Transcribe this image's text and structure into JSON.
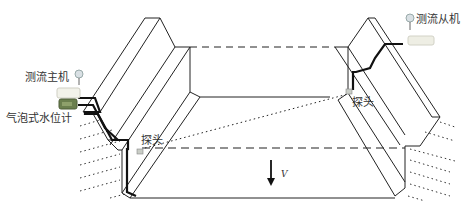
{
  "diagram": {
    "title": "",
    "labels": {
      "main_unit": "测流主机",
      "slave_unit": "测流从机",
      "bubble_gauge": "气泡式水位计",
      "probe_left": "探头",
      "probe_right": "探头",
      "velocity": "V"
    },
    "colors": {
      "line": "#222222",
      "cable": "#111111",
      "main_unit_body": "#f2f2ea",
      "gauge_body": "#6b7f4e",
      "slave_unit_body": "#eeeee4",
      "label_text": "#333333"
    },
    "nodes": [
      {
        "id": "main-unit",
        "label": "测流主机",
        "type": "instrument"
      },
      {
        "id": "bubble-gauge",
        "label": "气泡式水位计",
        "type": "instrument"
      },
      {
        "id": "slave-unit",
        "label": "测流从机",
        "type": "instrument"
      },
      {
        "id": "probe-left",
        "label": "探头",
        "type": "sensor"
      },
      {
        "id": "probe-right",
        "label": "探头",
        "type": "sensor"
      },
      {
        "id": "channel",
        "label": "",
        "type": "trapezoidal-channel"
      }
    ],
    "edges": [
      {
        "from": "main-unit",
        "to": "probe-left",
        "style": "cable"
      },
      {
        "from": "slave-unit",
        "to": "probe-right",
        "style": "cable"
      },
      {
        "from": "probe-left",
        "to": "probe-right",
        "style": "dotted-acoustic-path"
      }
    ]
  }
}
